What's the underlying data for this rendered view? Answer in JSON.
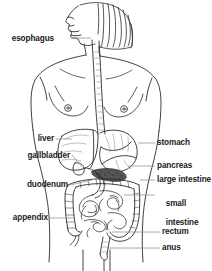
{
  "figure": {
    "style": "black line drawing on white background",
    "colors": {
      "background": "#ffffff",
      "ink": "#1a1a1a",
      "outline": "#2b2b2b",
      "leader_line": "#8d8d8d",
      "shading": "#6f6f6f"
    }
  },
  "labels": {
    "esophagus": "esophagus",
    "liver": "liver",
    "gallbladder": "gallbladder",
    "duodenum": "duodenum",
    "appendix": "appendix",
    "stomach": "stomach",
    "pancreas": "pancreas",
    "large_intestine": "large intestine",
    "small_intestine_line1": "small",
    "small_intestine_line2": "intestine",
    "rectum": "rectum",
    "anus": "anus"
  },
  "organs": [
    {
      "name": "esophagus",
      "side": "left"
    },
    {
      "name": "liver",
      "side": "left"
    },
    {
      "name": "gallbladder",
      "side": "left"
    },
    {
      "name": "duodenum",
      "side": "left"
    },
    {
      "name": "appendix",
      "side": "left"
    },
    {
      "name": "stomach",
      "side": "right"
    },
    {
      "name": "pancreas",
      "side": "right"
    },
    {
      "name": "large intestine",
      "side": "right"
    },
    {
      "name": "small intestine",
      "side": "right"
    },
    {
      "name": "rectum",
      "side": "right"
    },
    {
      "name": "anus",
      "side": "right"
    }
  ]
}
